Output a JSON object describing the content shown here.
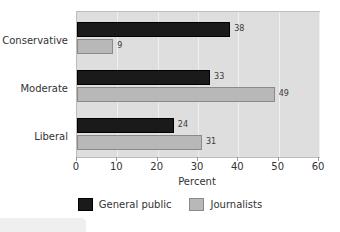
{
  "chart_data": {
    "type": "bar",
    "orientation": "horizontal",
    "title": "",
    "xlabel": "Percent",
    "ylabel": "",
    "xlim": [
      0,
      60
    ],
    "xticks": [
      0,
      10,
      20,
      30,
      40,
      50,
      60
    ],
    "xtick_labels": [
      "0",
      "10",
      "20",
      "30",
      "40",
      "50",
      "60"
    ],
    "categories": [
      "Conservative",
      "Moderate",
      "Liberal"
    ],
    "grid": true,
    "grid_axis": "x",
    "legend_position": "bottom-center",
    "series": [
      {
        "name": "General public",
        "color": "#1a1a1a",
        "values": [
          38,
          33,
          24
        ],
        "value_labels": [
          "38",
          "33",
          "24"
        ]
      },
      {
        "name": "Journalists",
        "color": "#b8b8b8",
        "values": [
          9,
          49,
          31
        ],
        "value_labels": [
          "9",
          "49",
          "31"
        ]
      }
    ]
  },
  "axis": {
    "x_label": "Percent",
    "ticks": [
      {
        "value": 0,
        "label": "0"
      },
      {
        "value": 10,
        "label": "10"
      },
      {
        "value": 20,
        "label": "20"
      },
      {
        "value": 30,
        "label": "30"
      },
      {
        "value": 40,
        "label": "40"
      },
      {
        "value": 50,
        "label": "50"
      },
      {
        "value": 60,
        "label": "60"
      }
    ]
  },
  "categories": [
    {
      "label": "Conservative",
      "general_public": "38",
      "journalists": "9"
    },
    {
      "label": "Moderate",
      "general_public": "33",
      "journalists": "49"
    },
    {
      "label": "Liberal",
      "general_public": "24",
      "journalists": "31"
    }
  ],
  "legend": {
    "entries": [
      {
        "label": "General public",
        "color": "#1a1a1a"
      },
      {
        "label": "Journalists",
        "color": "#b8b8b8"
      }
    ]
  },
  "fragments": {
    "title_fragment": ""
  }
}
